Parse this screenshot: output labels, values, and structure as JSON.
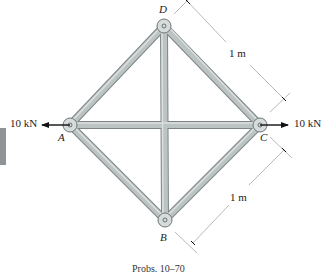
{
  "figure": {
    "nodes": {
      "A": {
        "label": "A",
        "x": 70,
        "y": 125
      },
      "B": {
        "label": "B",
        "x": 165,
        "y": 220
      },
      "C": {
        "label": "C",
        "x": 260,
        "y": 125
      },
      "D": {
        "label": "D",
        "x": 164,
        "y": 26
      }
    },
    "members": [
      "AD",
      "DC",
      "AB",
      "BC",
      "AC",
      "DB"
    ],
    "loads": {
      "left": {
        "label": "10 kN",
        "node": "A",
        "direction": "left"
      },
      "right": {
        "label": "10 kN",
        "node": "C",
        "direction": "right"
      }
    },
    "dimensions": {
      "upper": {
        "label": "1 m",
        "span": "D-C"
      },
      "lower": {
        "label": "1 m",
        "span": "C-B"
      }
    },
    "caption": "Probs. 10–70",
    "colors": {
      "member_fill": "#bcc3c3",
      "member_edge": "#7d8585",
      "pin_fill": "#d6dbdb",
      "ink": "#222222",
      "dim_line": "#888888",
      "side_tab": "#8e9496"
    }
  }
}
